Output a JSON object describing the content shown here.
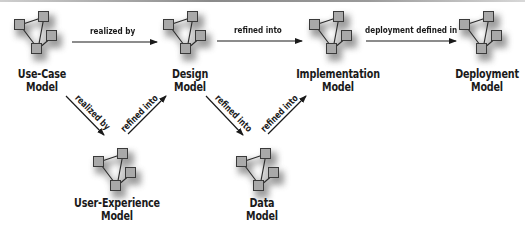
{
  "diagram": {
    "type": "model-flow",
    "colors": {
      "node_fill": "#a8a8a8",
      "node_stroke": "#3a3a3a",
      "shadow": "#8c8c8c",
      "text": "#1a1a1a",
      "arrow": "#1a1a1a"
    },
    "icon": "network-graph-icon",
    "nodes": [
      {
        "id": "use-case",
        "line1": "Use-Case",
        "line2": "Model"
      },
      {
        "id": "design",
        "line1": "Design",
        "line2": "Model"
      },
      {
        "id": "implementation",
        "line1": "Implementation",
        "line2": "Model"
      },
      {
        "id": "deployment",
        "line1": "Deployment",
        "line2": "Model"
      },
      {
        "id": "user-experience",
        "line1": "User-Experience",
        "line2": "Model"
      },
      {
        "id": "data",
        "line1": "Data",
        "line2": "Model"
      }
    ],
    "edges": [
      {
        "from": "use-case",
        "to": "design",
        "label": "realized by"
      },
      {
        "from": "design",
        "to": "implementation",
        "label": "refined into"
      },
      {
        "from": "implementation",
        "to": "deployment",
        "label": "deployment defined in"
      },
      {
        "from": "use-case",
        "to": "user-experience",
        "label": "realized by"
      },
      {
        "from": "user-experience",
        "to": "design",
        "label": "refined into"
      },
      {
        "from": "design",
        "to": "data",
        "label": "refined into"
      },
      {
        "from": "data",
        "to": "implementation",
        "label": "refined into"
      }
    ]
  }
}
